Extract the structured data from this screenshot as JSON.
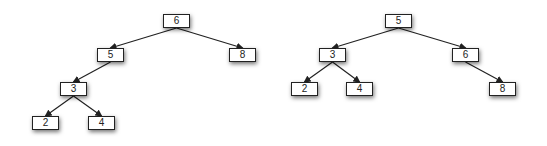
{
  "trees": [
    {
      "name": "left-tree",
      "nodes": [
        {
          "id": "L6",
          "label": "6"
        },
        {
          "id": "L5",
          "label": "5"
        },
        {
          "id": "L8",
          "label": "8"
        },
        {
          "id": "L3",
          "label": "3"
        },
        {
          "id": "L2",
          "label": "2"
        },
        {
          "id": "L4",
          "label": "4"
        }
      ],
      "edges": [
        [
          "L6",
          "L5"
        ],
        [
          "L6",
          "L8"
        ],
        [
          "L5",
          "L3"
        ],
        [
          "L3",
          "L2"
        ],
        [
          "L3",
          "L4"
        ]
      ]
    },
    {
      "name": "right-tree",
      "nodes": [
        {
          "id": "R5",
          "label": "5"
        },
        {
          "id": "R3",
          "label": "3"
        },
        {
          "id": "R6",
          "label": "6"
        },
        {
          "id": "R2",
          "label": "2"
        },
        {
          "id": "R4",
          "label": "4"
        },
        {
          "id": "R8",
          "label": "8"
        }
      ],
      "edges": [
        [
          "R5",
          "R3"
        ],
        [
          "R5",
          "R6"
        ],
        [
          "R3",
          "R2"
        ],
        [
          "R3",
          "R4"
        ],
        [
          "R6",
          "R8"
        ]
      ]
    }
  ],
  "colors": {
    "stroke": "#222222",
    "node_fill": "#ffffff"
  }
}
